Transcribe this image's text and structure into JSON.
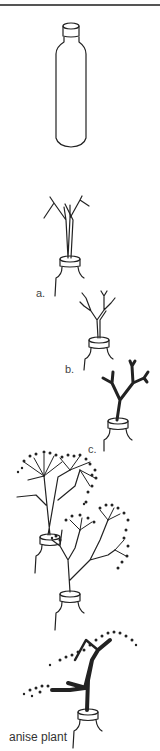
{
  "figure": {
    "type": "illustration",
    "labels": {
      "a": "a.",
      "b": "b.",
      "c": "c.",
      "final": "anise plant"
    },
    "colors": {
      "line": "#222222",
      "background": "#ffffff",
      "rule": "#555555"
    }
  }
}
